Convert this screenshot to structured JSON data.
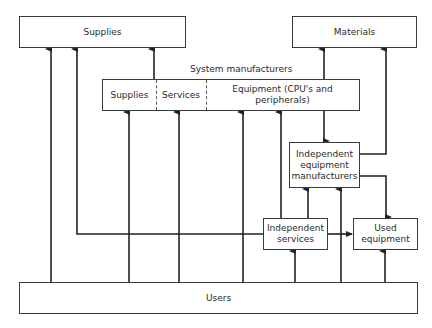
{
  "diagram": {
    "nodes": {
      "supplies": "Supplies",
      "materials": "Materials",
      "system_label": "System manufacturers",
      "system_segments": [
        "Supplies",
        "Services",
        "Equipment (CPU's and peripherals)"
      ],
      "independent_equipment": [
        "Independent",
        "equipment",
        "manufacturers"
      ],
      "independent_services": [
        "Independent",
        "services"
      ],
      "used_equipment": [
        "Used",
        "equipment"
      ],
      "users": "Users"
    },
    "edges": [
      {
        "from": "Users",
        "to": "Supplies"
      },
      {
        "from": "Independent services",
        "to": "Supplies"
      },
      {
        "from": "System manufacturers",
        "to": "Supplies"
      },
      {
        "from": "Users",
        "to": "System manufacturers: Supplies"
      },
      {
        "from": "Users",
        "to": "System manufacturers: Services"
      },
      {
        "from": "Users",
        "to": "System manufacturers: Equipment"
      },
      {
        "from": "Independent services",
        "to": "System manufacturers: Equipment"
      },
      {
        "from": "System manufacturers",
        "to": "Materials"
      },
      {
        "from": "System manufacturers",
        "to": "Independent equipment manufacturers"
      },
      {
        "from": "Independent equipment manufacturers",
        "to": "Materials"
      },
      {
        "from": "Independent equipment manufacturers",
        "to": "Used equipment"
      },
      {
        "from": "Independent services",
        "to": "Independent equipment manufacturers"
      },
      {
        "from": "Users",
        "to": "Independent equipment manufacturers"
      },
      {
        "from": "Users",
        "to": "Independent services"
      },
      {
        "from": "Independent services",
        "to": "Used equipment"
      },
      {
        "from": "Users",
        "to": "Used equipment"
      }
    ],
    "colors": {
      "line": "#222222",
      "box_border": "#3a3a3a",
      "background": "#ffffff"
    }
  }
}
